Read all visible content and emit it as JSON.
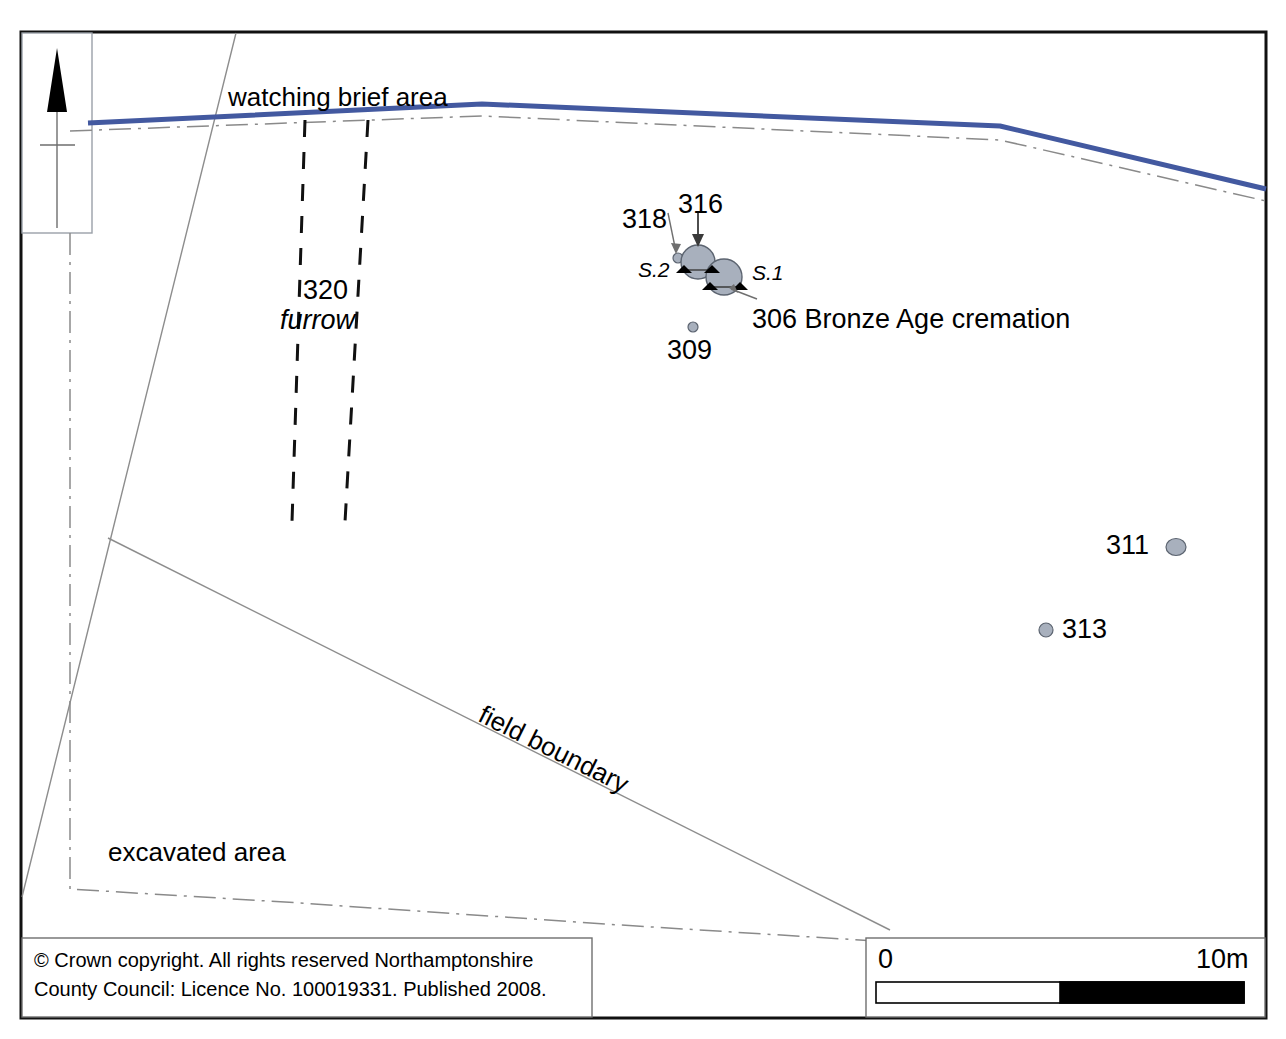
{
  "figure": {
    "kind": "archaeological-site-plan",
    "width": 1286,
    "height": 1039
  },
  "colors": {
    "watching_brief_line": "#4359a0",
    "feature_fill": "#a8b0bd",
    "feature_stroke": "#5c6470",
    "thin_line": "#7a7a7a",
    "border": "#111111",
    "dash_dot": "#8a8a8a",
    "scale_black": "#000000"
  },
  "north_arrow": {
    "name": "north-arrow",
    "label": ""
  },
  "boundaries": {
    "watching_brief_label": "watching brief area",
    "field_boundary_label": "field boundary",
    "excavated_area_label": "excavated area"
  },
  "furrow": {
    "number": "320",
    "label": "furrow"
  },
  "features": [
    {
      "id": "316",
      "label": "316",
      "type": "pit",
      "cx": 698,
      "cy": 262,
      "r": 17,
      "label_x": 678,
      "label_y": 192
    },
    {
      "id": "306",
      "label": "306 Bronze Age cremation",
      "type": "pit",
      "cx": 724,
      "cy": 277,
      "r": 18,
      "label_x": 752,
      "label_y": 306
    },
    {
      "id": "318",
      "label": "318",
      "type": "posthole",
      "cx": 678,
      "cy": 258,
      "r": 5,
      "label_x": 622,
      "label_y": 204
    },
    {
      "id": "309",
      "label": "309",
      "type": "posthole",
      "cx": 693,
      "cy": 327,
      "r": 5,
      "label_x": 667,
      "label_y": 337
    },
    {
      "id": "311",
      "label": "311",
      "type": "posthole",
      "cx": 1176,
      "cy": 547,
      "r": 9,
      "label_x": 1106,
      "label_y": 531
    },
    {
      "id": "313",
      "label": "313",
      "type": "posthole",
      "cx": 1046,
      "cy": 630,
      "r": 7,
      "label_x": 1062,
      "label_y": 615
    }
  ],
  "sections": [
    {
      "id": "S.2",
      "label": "S.2",
      "label_x": 638,
      "label_y": 258
    },
    {
      "id": "S.1",
      "label": "S.1",
      "label_x": 752,
      "label_y": 263
    }
  ],
  "scale_bar": {
    "start_label": "0",
    "end_label": "10m",
    "length_metres": 10,
    "divisions": 2
  },
  "copyright": {
    "line1": "© Crown copyright. All rights reserved Northamptonshire",
    "line2": "County Council: Licence No. 100019331. Published 2008."
  }
}
